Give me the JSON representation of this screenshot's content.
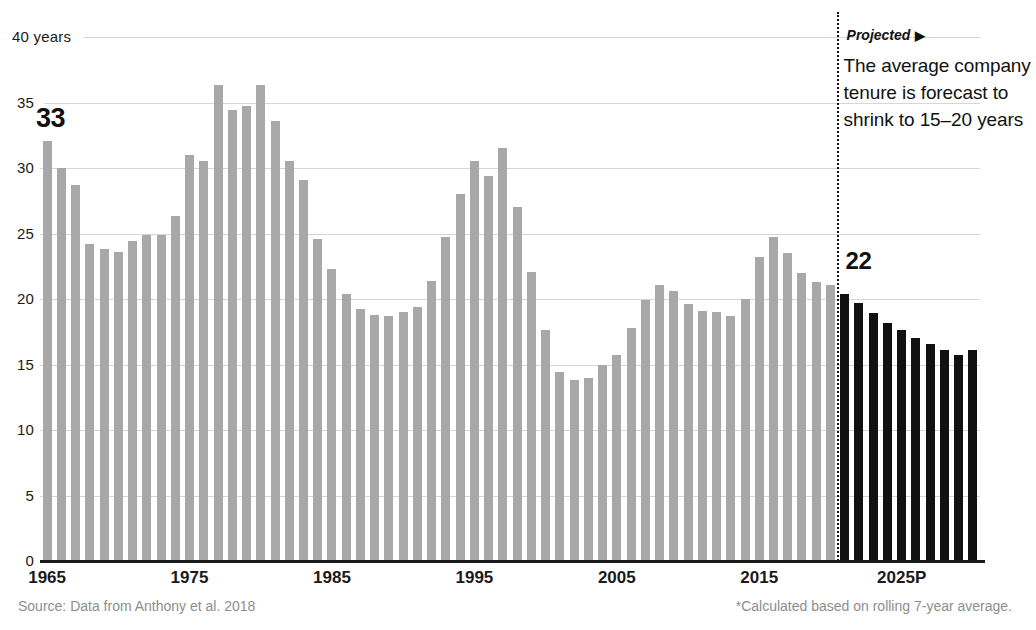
{
  "chart_data": {
    "type": "bar",
    "title": "",
    "xlabel": "",
    "ylabel": "years",
    "ylim": [
      0,
      40
    ],
    "xlim": [
      1965,
      2030
    ],
    "grid": true,
    "legend_position": "none",
    "y_ticks": [
      0,
      5,
      10,
      15,
      20,
      25,
      30,
      35,
      40
    ],
    "y_tick_labels": [
      "0",
      "5",
      "10",
      "15",
      "20",
      "25",
      "30",
      "35",
      "40 years"
    ],
    "x_ticks": [
      1965,
      1975,
      1985,
      1995,
      2005,
      2015,
      2025
    ],
    "x_tick_labels": [
      "1965",
      "1975",
      "1985",
      "1995",
      "2005",
      "2015",
      "2025P"
    ],
    "series": [
      {
        "name": "Average company tenure (actual)",
        "color": "#a8a8a8",
        "x": [
          1965,
          1966,
          1967,
          1968,
          1969,
          1970,
          1971,
          1972,
          1973,
          1974,
          1975,
          1976,
          1977,
          1978,
          1979,
          1980,
          1981,
          1982,
          1983,
          1984,
          1985,
          1986,
          1987,
          1988,
          1989,
          1990,
          1991,
          1992,
          1993,
          1994,
          1995,
          1996,
          1997,
          1998,
          1999,
          2000,
          2001,
          2002,
          2003,
          2004,
          2005,
          2006,
          2007,
          2008,
          2009,
          2010,
          2011,
          2012,
          2013,
          2014,
          2015,
          2016,
          2017,
          2018,
          2019,
          2020
        ],
        "values": [
          32.1,
          30.0,
          28.7,
          24.2,
          23.8,
          23.6,
          24.4,
          24.9,
          24.9,
          26.3,
          31.0,
          30.5,
          36.3,
          34.4,
          34.7,
          36.3,
          33.6,
          30.5,
          29.1,
          24.6,
          22.3,
          20.4,
          19.2,
          18.8,
          18.7,
          19.0,
          19.4,
          21.4,
          24.7,
          28.0,
          30.5,
          29.4,
          31.5,
          27.0,
          22.1,
          17.6,
          14.4,
          13.8,
          14.0,
          15.0,
          15.7,
          17.8,
          19.9,
          21.1,
          20.6,
          19.6,
          19.1,
          19.0,
          18.7,
          20.0,
          23.2,
          24.7,
          23.5,
          22.0,
          21.3,
          21.1
        ]
      },
      {
        "name": "Average company tenure (projected)",
        "color": "#111111",
        "x": [
          2021,
          2022,
          2023,
          2024,
          2025,
          2026,
          2027,
          2028,
          2029,
          2030
        ],
        "values": [
          20.4,
          19.7,
          18.9,
          18.2,
          17.6,
          17.0,
          16.6,
          16.1,
          15.7,
          16.1
        ]
      }
    ],
    "annotations": [
      {
        "name": "start-value-callout",
        "text": "33",
        "x": 1965,
        "y": 33
      },
      {
        "name": "projection-start-callout",
        "text": "22",
        "x": 2021,
        "y": 22
      },
      {
        "name": "projected-divider",
        "text": "Projected",
        "arrow": "▶",
        "x": 2020.5
      }
    ]
  },
  "axis": {
    "y_labels": [
      {
        "text": "40 years",
        "value": 40
      },
      {
        "text": "35",
        "value": 35
      },
      {
        "text": "30",
        "value": 30
      },
      {
        "text": "25",
        "value": 25
      },
      {
        "text": "20",
        "value": 20
      },
      {
        "text": "15",
        "value": 15
      },
      {
        "text": "10",
        "value": 10
      },
      {
        "text": "5",
        "value": 5
      },
      {
        "text": "0",
        "value": 0
      }
    ],
    "x_labels": [
      {
        "text": "1965",
        "value": 1965
      },
      {
        "text": "1975",
        "value": 1975
      },
      {
        "text": "1985",
        "value": 1985
      },
      {
        "text": "1995",
        "value": 1995
      },
      {
        "text": "2005",
        "value": 2005
      },
      {
        "text": "2015",
        "value": 2015
      },
      {
        "text": "2025P",
        "value": 2025
      }
    ]
  },
  "callouts": {
    "start_value": "33",
    "projection_value": "22",
    "projected_label": "Projected",
    "projected_arrow": "▶",
    "projection_note": "The average company tenure is forecast to shrink to 15–20 years"
  },
  "footer": {
    "source": "Source: Data from Anthony et al. 2018",
    "method": "*Calculated based on rolling 7-year average."
  },
  "colors": {
    "bar_actual": "#a8a8a8",
    "bar_projected": "#111111",
    "gridline": "#d6d6d6",
    "axis": "#1a1a1a",
    "footer_text": "#8d8d8d"
  }
}
